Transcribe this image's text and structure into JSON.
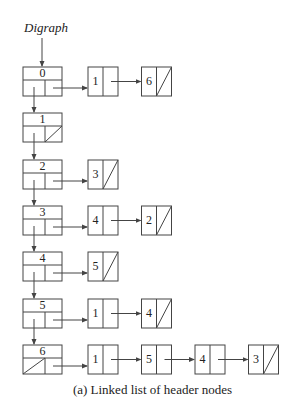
{
  "title": "Digraph",
  "caption": "(a) Linked list of header nodes",
  "colors": {
    "stroke": "#444444",
    "background": "#ffffff"
  },
  "header_nodes": [
    {
      "label": "0",
      "down_null": false,
      "right_null": false,
      "list": [
        "1",
        "6"
      ]
    },
    {
      "label": "1",
      "down_null": false,
      "right_null": true,
      "list": []
    },
    {
      "label": "2",
      "down_null": false,
      "right_null": false,
      "list": [
        "3"
      ]
    },
    {
      "label": "3",
      "down_null": false,
      "right_null": false,
      "list": [
        "4",
        "2"
      ]
    },
    {
      "label": "4",
      "down_null": false,
      "right_null": false,
      "list": [
        "5"
      ]
    },
    {
      "label": "5",
      "down_null": false,
      "right_null": false,
      "list": [
        "1",
        "4"
      ]
    },
    {
      "label": "6",
      "down_null": true,
      "right_null": false,
      "list": [
        "1",
        "5",
        "4",
        "3"
      ]
    }
  ]
}
